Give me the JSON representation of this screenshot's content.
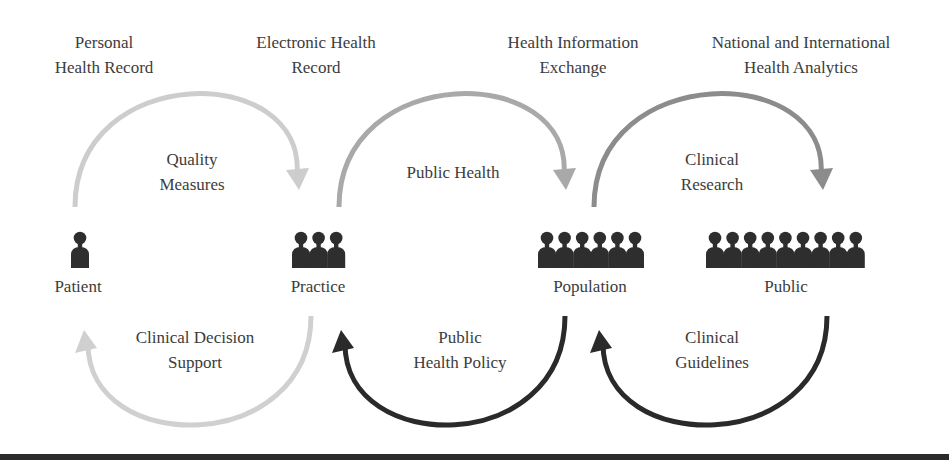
{
  "systems": [
    {
      "id": "phr",
      "lines": [
        "Personal",
        "Health Record"
      ],
      "x": 104,
      "y": 30
    },
    {
      "id": "ehr",
      "lines": [
        "Electronic Health",
        "Record"
      ],
      "x": 316,
      "y": 30
    },
    {
      "id": "hie",
      "lines": [
        "Health Information",
        "Exchange"
      ],
      "x": 573,
      "y": 30
    },
    {
      "id": "analytics",
      "lines": [
        "National and International",
        "Health Analytics"
      ],
      "x": 801,
      "y": 30
    }
  ],
  "nodes": [
    {
      "id": "patient",
      "label": "Patient",
      "figures": 1,
      "x": 78,
      "icon_left": 71
    },
    {
      "id": "practice",
      "label": "Practice",
      "figures": 3,
      "x": 318,
      "icon_left": 292
    },
    {
      "id": "population",
      "label": "Population",
      "figures": 6,
      "x": 590,
      "icon_left": 538
    },
    {
      "id": "public",
      "label": "Public",
      "figures": 9,
      "x": 786,
      "icon_left": 706
    }
  ],
  "top_flows": [
    {
      "id": "quality-measures",
      "lines": [
        "Quality",
        "Measures"
      ],
      "x": 192,
      "y": 147,
      "color": "#cdcdcd",
      "from_x": 75,
      "to_x": 299
    },
    {
      "id": "public-health",
      "lines": [
        "Public Health"
      ],
      "x": 453,
      "y": 160,
      "color": "#a9a9a9",
      "from_x": 339,
      "to_x": 566
    },
    {
      "id": "clinical-research",
      "lines": [
        "Clinical",
        "Research"
      ],
      "x": 712,
      "y": 147,
      "color": "#8c8c8c",
      "from_x": 594,
      "to_x": 823
    }
  ],
  "bottom_flows": [
    {
      "id": "clinical-decision-support",
      "lines": [
        "Clinical Decision",
        "Support"
      ],
      "x": 195,
      "y": 325,
      "color": "#d0d0d0",
      "from_x": 311,
      "to_x": 85
    },
    {
      "id": "public-health-policy",
      "lines": [
        "Public",
        "Health Policy"
      ],
      "x": 460,
      "y": 325,
      "color": "#2a2a2a",
      "from_x": 565,
      "to_x": 342
    },
    {
      "id": "clinical-guidelines",
      "lines": [
        "Clinical",
        "Guidelines"
      ],
      "x": 712,
      "y": 325,
      "color": "#2a2a2a",
      "from_x": 827,
      "to_x": 600
    }
  ],
  "colors": {
    "icon": "#2e2e2e",
    "text": "#3c3c3c",
    "bottom_bar": "#2b2b2b"
  }
}
